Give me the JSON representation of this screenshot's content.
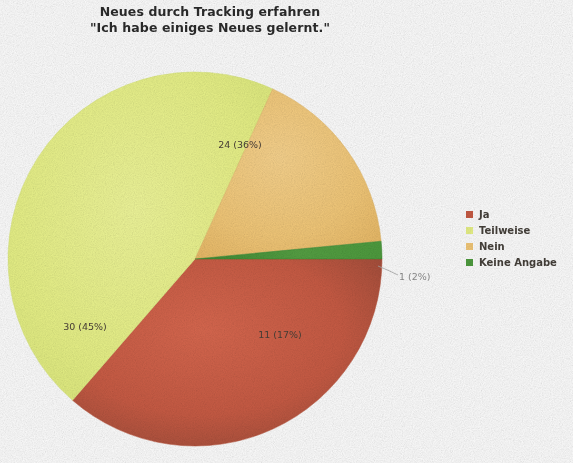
{
  "title": {
    "line1": "Neues durch Tracking erfahren",
    "line2": "\"Ich habe einiges Neues gelernt.\""
  },
  "legend": {
    "items": [
      {
        "label": "Ja",
        "color": "#c85b44"
      },
      {
        "label": "Teilweise",
        "color": "#e8f287"
      },
      {
        "label": "Nein",
        "color": "#f3c878"
      },
      {
        "label": "Keine Angabe",
        "color": "#4e9c3e"
      }
    ]
  },
  "labels": {
    "ja": "24 (36%)",
    "teilweise": "30 (45%)",
    "nein": "11 (17%)",
    "keine_angabe": "1 (2%)"
  },
  "chart_data": {
    "type": "pie",
    "title": "Neues durch Tracking erfahren \"Ich habe einiges Neues gelernt.\"",
    "categories": [
      "Ja",
      "Teilweise",
      "Nein",
      "Keine Angabe"
    ],
    "values": [
      24,
      30,
      11,
      1
    ],
    "percentages": [
      36,
      45,
      17,
      2
    ],
    "total": 66,
    "data_labels": [
      "24 (36%)",
      "30 (45%)",
      "11 (17%)",
      "1 (2%)"
    ],
    "colors": [
      "#c85b44",
      "#e8f287",
      "#f3c878",
      "#4e9c3e"
    ],
    "legend_position": "right",
    "start_angle_deg": 0,
    "direction": "clockwise",
    "grid": false,
    "xlabel": "",
    "ylabel": ""
  }
}
